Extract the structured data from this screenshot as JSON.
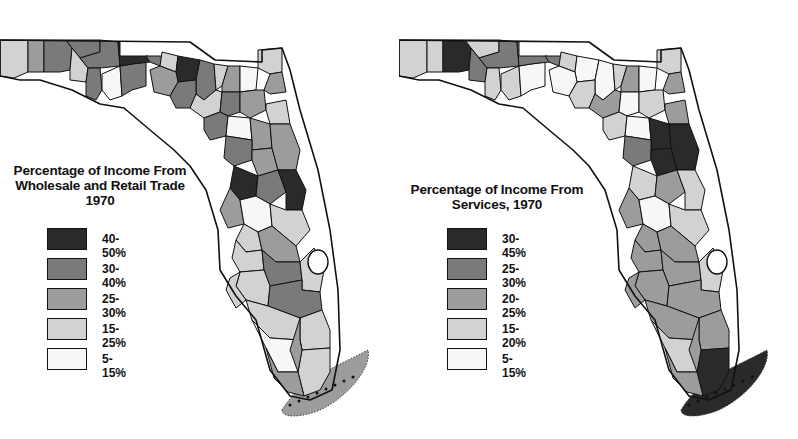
{
  "chart_data": [
    {
      "type": "choropleth",
      "title": "Percentage of Income From Wholesale and Retail Trade 1970",
      "title_lines": [
        "Percentage of Income From",
        "Wholesale and Retail Trade",
        "1970"
      ],
      "region": "Florida counties",
      "legend": [
        {
          "label": "40-50%",
          "color": "#2a2a2a"
        },
        {
          "label": "30-40%",
          "color": "#7a7a7a"
        },
        {
          "label": "25-30%",
          "color": "#9c9c9c"
        },
        {
          "label": "15-25%",
          "color": "#d2d2d2"
        },
        {
          "label": "5-15%",
          "color": "#f7f7f7"
        }
      ],
      "keys_region_class": "25-30%"
    },
    {
      "type": "choropleth",
      "title": "Percentage of Income From Services, 1970",
      "title_lines": [
        "Percentage of Income From",
        "Services, 1970"
      ],
      "region": "Florida counties",
      "legend": [
        {
          "label": "30-45%",
          "color": "#2a2a2a"
        },
        {
          "label": "25-30%",
          "color": "#7a7a7a"
        },
        {
          "label": "20-25%",
          "color": "#9c9c9c"
        },
        {
          "label": "15-20%",
          "color": "#d2d2d2"
        },
        {
          "label": "5-15%",
          "color": "#f7f7f7"
        }
      ],
      "keys_region_class": "30-45%"
    }
  ],
  "maps": {
    "left": {
      "title_line1": "Percentage of Income From",
      "title_line2": "Wholesale and Retail Trade",
      "title_line3": "1970",
      "legend": [
        "40-50%",
        "30-40%",
        "25-30%",
        "15-25%",
        "5-15%"
      ],
      "county_classes": [
        3,
        2,
        1,
        1,
        3,
        1,
        1,
        4,
        1,
        0,
        1,
        3,
        0,
        1,
        3,
        2,
        4,
        3,
        2,
        2,
        1,
        3,
        1,
        2,
        3,
        1,
        4,
        2,
        1,
        2,
        2,
        0,
        1,
        0,
        2,
        4,
        3,
        3,
        2,
        3,
        1,
        3,
        3,
        1,
        3,
        3,
        4,
        3,
        2,
        3,
        2
      ],
      "keys_class": 2
    },
    "right": {
      "title_line1": "Percentage of Income From",
      "title_line2": "Services, 1970",
      "legend": [
        "30-45%",
        "25-30%",
        "20-25%",
        "15-20%",
        "5-15%"
      ],
      "county_classes": [
        3,
        3,
        0,
        3,
        1,
        1,
        3,
        3,
        4,
        1,
        1,
        3,
        4,
        4,
        3,
        2,
        4,
        3,
        2,
        4,
        3,
        2,
        4,
        3,
        2,
        3,
        4,
        0,
        1,
        0,
        0,
        3,
        2,
        3,
        2,
        4,
        3,
        2,
        2,
        2,
        2,
        3,
        2,
        2,
        2,
        2,
        3,
        0,
        2,
        2,
        2
      ],
      "keys_class": 0
    }
  },
  "palette": [
    "#2a2a2a",
    "#7a7a7a",
    "#9c9c9c",
    "#d2d2d2",
    "#f7f7f7"
  ]
}
